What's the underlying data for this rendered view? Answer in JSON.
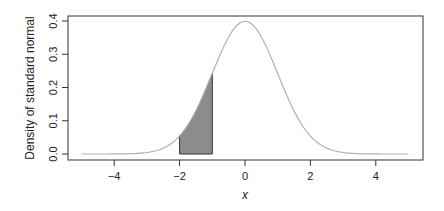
{
  "chart_data": {
    "type": "line",
    "title": "",
    "xlabel": "x",
    "ylabel": "Density of standard normal",
    "xlim": [
      -5.2,
      5.3
    ],
    "ylim": [
      -0.016,
      0.415
    ],
    "x_ticks": [
      -4,
      -2,
      0,
      2,
      4
    ],
    "x_tick_labels": [
      "−4",
      "−2",
      "0",
      "2",
      "4"
    ],
    "y_ticks": [
      0.0,
      0.1,
      0.2,
      0.3,
      0.4
    ],
    "y_tick_labels": [
      "0.0",
      "0.1",
      "0.2",
      "0.3",
      "0.4"
    ],
    "grid": false,
    "legend": null,
    "series": [
      {
        "name": "standard normal density",
        "function": "dnorm(x)",
        "x_range": [
          -5,
          5
        ],
        "color": "#b0b0b0",
        "sample_points": [
          {
            "x": -5,
            "y": 0.0
          },
          {
            "x": -4,
            "y": 0.0001
          },
          {
            "x": -3,
            "y": 0.0044
          },
          {
            "x": -2,
            "y": 0.054
          },
          {
            "x": -1,
            "y": 0.242
          },
          {
            "x": 0,
            "y": 0.3989
          },
          {
            "x": 1,
            "y": 0.242
          },
          {
            "x": 2,
            "y": 0.054
          },
          {
            "x": 3,
            "y": 0.0044
          },
          {
            "x": 4,
            "y": 0.0001
          },
          {
            "x": 5,
            "y": 0.0
          }
        ]
      }
    ],
    "shaded_region": {
      "x_from": -2,
      "x_to": -1,
      "fill": "#8c8c8c",
      "stroke": "#333333",
      "area": 0.1359
    }
  }
}
